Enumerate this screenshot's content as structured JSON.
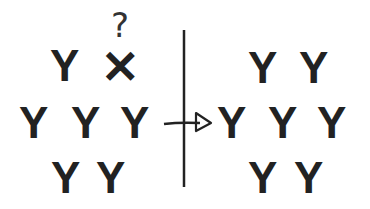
{
  "diagram": {
    "left": {
      "rows": [
        [
          "Y",
          "✕"
        ],
        [
          "Y",
          "Y",
          "Y"
        ],
        [
          "Y",
          "Y"
        ]
      ],
      "question_mark": "?"
    },
    "right": {
      "rows": [
        [
          "Y",
          "Y"
        ],
        [
          "Y",
          "Y",
          "Y"
        ],
        [
          "Y",
          "Y"
        ]
      ]
    },
    "colors": {
      "ink": "#222222",
      "background": "#ffffff"
    }
  }
}
